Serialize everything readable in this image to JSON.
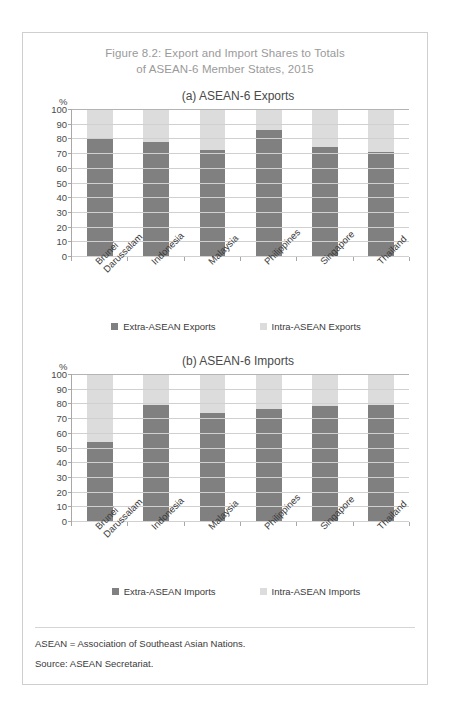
{
  "figure": {
    "title_line1": "Figure 8.2: Export and Import Shares to Totals",
    "title_line2": "of ASEAN-6 Member States, 2015"
  },
  "notes": {
    "abbreviation": "ASEAN = Association of Southeast Asian Nations.",
    "source": "Source: ASEAN Secretariat."
  },
  "colors": {
    "extra": "#808080",
    "intra": "#dcdcdc",
    "title": "#9a9a9a",
    "axis": "#a8a8a8",
    "grid": "#d0d0d0",
    "border": "#cfcfcf"
  },
  "axis": {
    "unit": "%",
    "ticks": [
      "100",
      "90",
      "80",
      "70",
      "60",
      "50",
      "40",
      "30",
      "20",
      "10",
      "0"
    ]
  },
  "categories": [
    {
      "line1": "Brunei",
      "line2": "Darussalam"
    },
    {
      "line1": "Indonesia",
      "line2": ""
    },
    {
      "line1": "Malaysia",
      "line2": ""
    },
    {
      "line1": "Philippines",
      "line2": ""
    },
    {
      "line1": "Singapore",
      "line2": ""
    },
    {
      "line1": "Thailand",
      "line2": ""
    }
  ],
  "chart_data": [
    {
      "type": "bar",
      "stacked": true,
      "panel": "a",
      "title": "(a) ASEAN-6 Exports",
      "xlabel": "",
      "ylabel": "%",
      "ylim": [
        0,
        100
      ],
      "ytick_step": 10,
      "grid": true,
      "legend_position": "bottom",
      "categories": [
        "Brunei Darussalam",
        "Indonesia",
        "Malaysia",
        "Philippines",
        "Singapore",
        "Thailand"
      ],
      "series": [
        {
          "name": "Extra-ASEAN Exports",
          "color": "#808080",
          "values": [
            80.0,
            77.5,
            72.0,
            85.5,
            74.5,
            71.0
          ]
        },
        {
          "name": "Intra-ASEAN Exports",
          "color": "#dcdcdc",
          "values": [
            20.0,
            22.5,
            28.0,
            14.5,
            25.5,
            29.0
          ]
        }
      ]
    },
    {
      "type": "bar",
      "stacked": true,
      "panel": "b",
      "title": "(b) ASEAN-6 Imports",
      "xlabel": "",
      "ylabel": "%",
      "ylim": [
        0,
        100
      ],
      "ytick_step": 10,
      "grid": true,
      "legend_position": "bottom",
      "categories": [
        "Brunei Darussalam",
        "Indonesia",
        "Malaysia",
        "Philippines",
        "Singapore",
        "Thailand"
      ],
      "series": [
        {
          "name": "Extra-ASEAN Imports",
          "color": "#808080",
          "values": [
            54.0,
            79.0,
            73.5,
            76.0,
            78.5,
            79.0
          ]
        },
        {
          "name": "Intra-ASEAN Imports",
          "color": "#dcdcdc",
          "values": [
            46.0,
            21.0,
            26.5,
            24.0,
            21.5,
            21.0
          ]
        }
      ]
    }
  ]
}
